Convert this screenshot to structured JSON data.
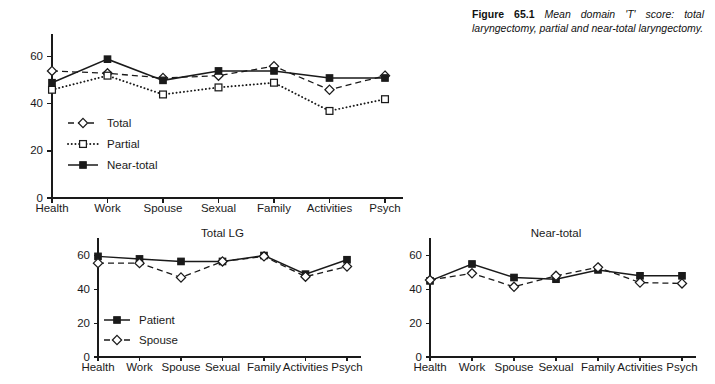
{
  "caption": {
    "label": "Figure 65.1",
    "text": "Mean domain 'T' score: total laryngectomy, partial and near-total laryngectomy."
  },
  "chart_data": [
    {
      "id": "main",
      "type": "line",
      "title": "",
      "xlabel": "",
      "ylabel": "",
      "ylim": [
        0,
        68
      ],
      "yticks": [
        0,
        20,
        40,
        60
      ],
      "ytick_labels": [
        "0",
        "20",
        "40",
        "60"
      ],
      "grid": false,
      "legend_position": "inside-lower-left",
      "categories": [
        "Health",
        "Work",
        "Spouse",
        "Sexual",
        "Family",
        "Activities",
        "Psych"
      ],
      "series": [
        {
          "name": "Total",
          "style": "dashed",
          "marker": "diamond-open",
          "values": [
            54,
            53,
            51,
            52,
            56,
            46,
            52
          ]
        },
        {
          "name": "Partial",
          "style": "dotted",
          "marker": "square-open",
          "values": [
            46,
            52,
            44,
            47,
            49,
            37,
            42
          ]
        },
        {
          "name": "Near-total",
          "style": "solid",
          "marker": "square-filled",
          "values": [
            49,
            59,
            50,
            54,
            54,
            51,
            51
          ]
        }
      ]
    },
    {
      "id": "total-lg",
      "type": "line",
      "title": "Total LG",
      "xlabel": "",
      "ylabel": "",
      "ylim": [
        0,
        68
      ],
      "yticks": [
        0,
        20,
        40,
        60
      ],
      "ytick_labels": [
        "0",
        "20",
        "40",
        "60"
      ],
      "grid": false,
      "legend_position": "inside-lower-left",
      "categories": [
        "Health",
        "Work",
        "Spouse",
        "Sexual",
        "Family",
        "Activities",
        "Psych"
      ],
      "series": [
        {
          "name": "Patient",
          "style": "solid",
          "marker": "square-filled",
          "values": [
            59.5,
            58,
            56.5,
            56.5,
            60,
            49,
            57.5
          ]
        },
        {
          "name": "Spouse",
          "style": "dashed",
          "marker": "diamond-open",
          "values": [
            55.5,
            55.5,
            47,
            56.5,
            59.5,
            47.5,
            53.5
          ]
        }
      ]
    },
    {
      "id": "near-total",
      "type": "line",
      "title": "Near-total",
      "xlabel": "",
      "ylabel": "",
      "ylim": [
        0,
        68
      ],
      "yticks": [
        0,
        20,
        40,
        60
      ],
      "ytick_labels": [
        "0",
        "20",
        "40",
        "60"
      ],
      "grid": false,
      "legend_position": "none",
      "categories": [
        "Health",
        "Work",
        "Spouse",
        "Sexual",
        "Family",
        "Activities",
        "Psych"
      ],
      "series": [
        {
          "name": "Patient",
          "style": "solid",
          "marker": "square-filled",
          "values": [
            45,
            55,
            47,
            46,
            51.5,
            48,
            48
          ]
        },
        {
          "name": "Spouse",
          "style": "dashed",
          "marker": "diamond-open",
          "values": [
            45.5,
            49.5,
            41.5,
            48,
            53,
            44,
            43.5
          ]
        }
      ]
    }
  ]
}
